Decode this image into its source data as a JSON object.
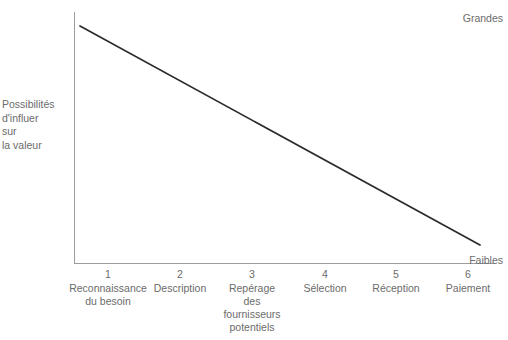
{
  "chart_data": {
    "type": "line",
    "title": "",
    "xlabel": "",
    "ylabel": "Possibilités d'influer sur la valeur",
    "ylabel_lines": [
      "Possibilités",
      "d'influer",
      "sur",
      "la valeur"
    ],
    "y_top_label": "Grandes",
    "y_bottom_label": "Faibles",
    "ylim": [
      0,
      100
    ],
    "grid": false,
    "legend": "none",
    "x": [
      1,
      2,
      3,
      4,
      5,
      6
    ],
    "categories": [
      "Reconnaissance du besoin",
      "Description",
      "Repérage des fournisseurs potentiels",
      "Sélection",
      "Réception",
      "Paiement"
    ],
    "category_lines": [
      [
        "Reconnaissance",
        "du besoin"
      ],
      [
        "Description"
      ],
      [
        "Repérage",
        "des",
        "fournisseurs",
        "potentiels"
      ],
      [
        "Sélection"
      ],
      [
        "Réception"
      ],
      [
        "Paiement"
      ]
    ],
    "tick_numbers": [
      "1",
      "2",
      "3",
      "4",
      "5",
      "6"
    ],
    "series": [
      {
        "name": "Possibilités d'influer sur la valeur",
        "values": [
          100,
          83.6,
          67.3,
          50.9,
          34.6,
          18.2
        ],
        "color": "#2b2b2b"
      }
    ],
    "line_geometry": {
      "x1": 80,
      "y1": 26,
      "x2": 480,
      "y2": 245,
      "stroke_width": 1.7
    },
    "axis_color": "#9c9c9c",
    "text_color": "#6b6b6b",
    "background": "#ffffff"
  }
}
